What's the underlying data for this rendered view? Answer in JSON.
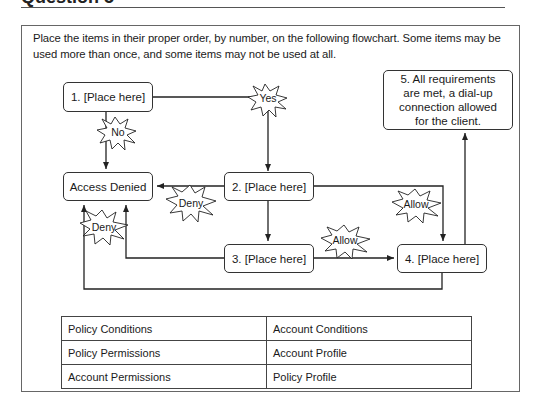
{
  "question": {
    "heading": "Question 5",
    "instructions": "Place the items in their proper order, by number, on the following flowchart. Some items may be used more than once, and some items may not be used at all."
  },
  "flowchart": {
    "nodes": {
      "n1": "1. [Place here]",
      "access_denied": "Access Denied",
      "n2": "2. [Place here]",
      "n3": "3. [Place here]",
      "n4": "4. [Place here]",
      "n5": "5. All requirements are met, a dial-up connection allowed for the client."
    },
    "labels": {
      "yes": "Yes",
      "no": "No",
      "deny_2": "Deny",
      "deny_3": "Deny",
      "allow_2": "Allow",
      "allow_3": "Allow"
    }
  },
  "options": {
    "rows": [
      [
        "Policy Conditions",
        "Account Conditions"
      ],
      [
        "Policy Permissions",
        "Account Profile"
      ],
      [
        "Account Permissions",
        "Policy Profile"
      ]
    ]
  }
}
